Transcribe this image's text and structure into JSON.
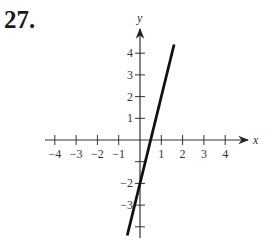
{
  "problem": {
    "number": "27."
  },
  "chart_data": {
    "type": "line",
    "title": "",
    "xlabel": "x",
    "ylabel": "y",
    "xlim": [
      -4.5,
      5
    ],
    "ylim": [
      -4.5,
      4.5
    ],
    "grid": false,
    "x_ticks": [
      -4,
      -3,
      -2,
      -1,
      1,
      2,
      3,
      4
    ],
    "x_tick_labels": [
      "−4",
      "−3",
      "−2",
      "−1",
      "1",
      "2",
      "3",
      "4"
    ],
    "y_ticks": [
      4,
      3,
      2,
      1,
      -1,
      -2,
      -3,
      -4
    ],
    "y_tick_labels": [
      "4",
      "3",
      "2",
      "1",
      "",
      "−2",
      "−3",
      ""
    ],
    "series": [
      {
        "name": "line",
        "equation": "y = 4x - 2",
        "x": [
          -0.6,
          1.6
        ],
        "y": [
          -4.4,
          4.4
        ],
        "color": "#111111"
      }
    ]
  },
  "layout": {
    "origin_px": [
      140,
      140
    ],
    "unit_x_px": 21.3,
    "unit_y_px": 21.7
  }
}
